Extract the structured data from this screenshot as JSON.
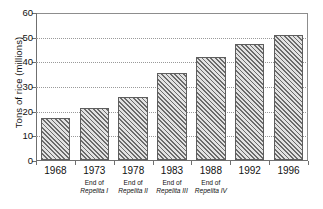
{
  "chart_data": {
    "type": "bar",
    "title": "",
    "xlabel": "",
    "ylabel": "Tons of rice (millions)",
    "categories": [
      "1968",
      "1973",
      "1978",
      "1983",
      "1988",
      "1992",
      "1996"
    ],
    "category_sublabels": [
      "",
      "End of Repelita I",
      "End of Repelita II",
      "End of Repelita III",
      "End of Repelita IV",
      "",
      ""
    ],
    "category_sublabel_lines": [
      [
        "",
        ""
      ],
      [
        "End of",
        "Repelita I"
      ],
      [
        "End of",
        "Repelita II"
      ],
      [
        "End of",
        "Repelita III"
      ],
      [
        "End of",
        "Repelita IV"
      ],
      [
        "",
        ""
      ],
      [
        "",
        ""
      ]
    ],
    "values": [
      17,
      21,
      25.5,
      35,
      41.5,
      47,
      50.5
    ],
    "ylim": [
      0,
      60
    ],
    "yticks": [
      0,
      10,
      20,
      30,
      40,
      50,
      60
    ],
    "ytick_labels": [
      "0",
      "10",
      "20",
      "30",
      "40",
      "50",
      "60"
    ],
    "grid": true,
    "grid_axis": "y",
    "grid_style": "dotted",
    "legend": "none",
    "bar_fill": "diagonal-hatch",
    "colors": {
      "bar_hatch": "#6b6b6b",
      "bar_background": "#e2e2e2",
      "bar_border": "#5e5e5e",
      "axis": "#6f6f6f",
      "gridline": "#9a9a9a",
      "text": "#111111",
      "page_background": "#ffffff"
    }
  },
  "caption": {
    "text": ""
  }
}
